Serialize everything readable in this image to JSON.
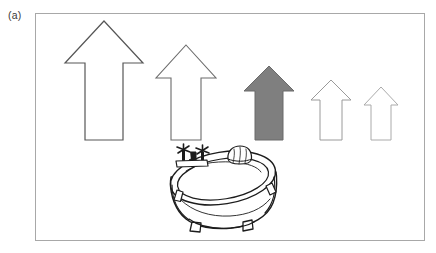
{
  "figure": {
    "panel_label": "(a)",
    "caption_elements": [
      "arrow-series",
      "bathtub-illustration"
    ],
    "background_color": "#ffffff",
    "frame": {
      "name": "figure-border",
      "x": 35,
      "y": 13,
      "width": 389,
      "height": 227,
      "stroke": "#a8a8a8",
      "stroke_width": 1,
      "fill": "#ffffff"
    },
    "arrows": {
      "label": "upward arrow series (decreasing size, left to right)",
      "count": 5,
      "baseline_y": 140,
      "items": [
        {
          "id": "arrow-1",
          "rank": 1,
          "size_label": "largest",
          "fill": "#ffffff",
          "stroke": "#565656",
          "stroke_width": 1.2,
          "tip_x": 104,
          "tip_y": 21,
          "head_half_width": 39,
          "head_base_y": 63,
          "stem_half_width": 19,
          "base_y": 140
        },
        {
          "id": "arrow-2",
          "rank": 2,
          "size_label": "large",
          "fill": "#ffffff",
          "stroke": "#6b6b6b",
          "stroke_width": 1.1,
          "tip_x": 186,
          "tip_y": 45,
          "head_half_width": 30,
          "head_base_y": 78,
          "stem_half_width": 15,
          "base_y": 140
        },
        {
          "id": "arrow-3",
          "rank": 3,
          "size_label": "medium (highlighted)",
          "fill": "#7f7f7f",
          "stroke": "#6a6a6a",
          "stroke_width": 1,
          "tip_x": 269,
          "tip_y": 66,
          "head_half_width": 25,
          "head_base_y": 91,
          "stem_half_width": 14,
          "base_y": 140,
          "highlighted": true
        },
        {
          "id": "arrow-4",
          "rank": 4,
          "size_label": "small",
          "fill": "#ffffff",
          "stroke": "#9a9a9a",
          "stroke_width": 1,
          "tip_x": 331,
          "tip_y": 80,
          "head_half_width": 20,
          "head_base_y": 100,
          "stem_half_width": 11,
          "base_y": 140
        },
        {
          "id": "arrow-5",
          "rank": 5,
          "size_label": "smallest",
          "fill": "#ffffff",
          "stroke": "#aaaaaa",
          "stroke_width": 1,
          "tip_x": 381,
          "tip_y": 87,
          "head_half_width": 17,
          "head_base_y": 105,
          "stem_half_width": 10,
          "base_y": 140
        }
      ]
    },
    "bathtub": {
      "label": "clawfoot bathtub line drawing",
      "center_x": 222,
      "top_y": 145,
      "bottom_y": 232,
      "stroke": "#1c1c1c",
      "fill": "#ffffff",
      "parts": [
        {
          "id": "tub-rim",
          "label": "oval rim"
        },
        {
          "id": "tub-basin",
          "label": "inner basin"
        },
        {
          "id": "tub-body",
          "label": "outer body / skirt"
        },
        {
          "id": "faucet-assembly",
          "label": "faucet with two cross handles"
        },
        {
          "id": "soap-object",
          "label": "rounded sponge / soap on rim"
        },
        {
          "id": "tub-foot-left",
          "label": "claw foot left"
        },
        {
          "id": "tub-foot-right",
          "label": "claw foot right"
        },
        {
          "id": "tub-foot-front-left",
          "label": "claw foot front left"
        },
        {
          "id": "tub-foot-front-right",
          "label": "claw foot front right"
        }
      ]
    }
  }
}
